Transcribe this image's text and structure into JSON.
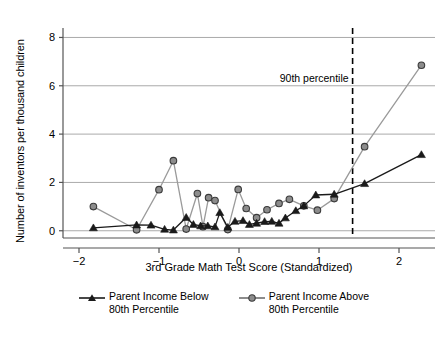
{
  "chart_data": {
    "type": "line",
    "title": "",
    "xlabel": "3rd Grade Math Test Score (Standardized)",
    "ylabel": "Number of inventors per thousand children",
    "xlim": [
      -2.2,
      2.45
    ],
    "ylim": [
      -0.3,
      8.35
    ],
    "xticks": [
      -2,
      -1,
      0,
      1,
      2
    ],
    "xticklabels": [
      "-2",
      "-1",
      "0",
      "1",
      "2"
    ],
    "yticks": [
      0,
      2,
      4,
      6,
      8
    ],
    "yticklabels": [
      "0",
      "2",
      "4",
      "6",
      "8"
    ],
    "grid": "horizontal",
    "legend_position": "below",
    "annotations": [
      {
        "text": "90th percentile",
        "x": 1.42,
        "y": 6.3,
        "type": "vline-label"
      }
    ],
    "reference_lines": [
      {
        "orientation": "vertical",
        "x": 1.42,
        "style": "dashed",
        "color": "#000000",
        "label": "90th percentile"
      }
    ],
    "series": [
      {
        "name": "Parent Income Below\n80th Percentile",
        "marker": "triangle",
        "marker_color": "#1a1a1a",
        "line_color": "#1a1a1a",
        "points": [
          {
            "x": -1.82,
            "y": 0.12
          },
          {
            "x": -1.28,
            "y": 0.24
          },
          {
            "x": -1.1,
            "y": 0.23
          },
          {
            "x": -0.93,
            "y": 0.06
          },
          {
            "x": -0.82,
            "y": 0.03
          },
          {
            "x": -0.66,
            "y": 0.55
          },
          {
            "x": -0.57,
            "y": 0.26
          },
          {
            "x": -0.48,
            "y": 0.2
          },
          {
            "x": -0.39,
            "y": 0.2
          },
          {
            "x": -0.3,
            "y": 0.16
          },
          {
            "x": -0.24,
            "y": 0.75
          },
          {
            "x": -0.14,
            "y": 0.14
          },
          {
            "x": -0.05,
            "y": 0.39
          },
          {
            "x": 0.05,
            "y": 0.42
          },
          {
            "x": 0.13,
            "y": 0.26
          },
          {
            "x": 0.22,
            "y": 0.31
          },
          {
            "x": 0.32,
            "y": 0.38
          },
          {
            "x": 0.41,
            "y": 0.39
          },
          {
            "x": 0.5,
            "y": 0.31
          },
          {
            "x": 0.58,
            "y": 0.53
          },
          {
            "x": 0.71,
            "y": 0.83
          },
          {
            "x": 0.81,
            "y": 1.03
          },
          {
            "x": 0.96,
            "y": 1.48
          },
          {
            "x": 1.19,
            "y": 1.51
          },
          {
            "x": 1.57,
            "y": 1.95
          },
          {
            "x": 2.28,
            "y": 3.15
          }
        ]
      },
      {
        "name": "Parent Income Above\n80th Percentile",
        "marker": "circle",
        "marker_color": "#8c8c8c",
        "marker_edge": "#3a3a3a",
        "line_color": "#9a9a9a",
        "points": [
          {
            "x": -1.82,
            "y": 1.0
          },
          {
            "x": -1.28,
            "y": 0.04
          },
          {
            "x": -1.0,
            "y": 1.7
          },
          {
            "x": -0.82,
            "y": 2.9
          },
          {
            "x": -0.66,
            "y": 0.07
          },
          {
            "x": -0.52,
            "y": 1.54
          },
          {
            "x": -0.45,
            "y": 0.17
          },
          {
            "x": -0.38,
            "y": 1.37
          },
          {
            "x": -0.3,
            "y": 1.25
          },
          {
            "x": -0.14,
            "y": 0.05
          },
          {
            "x": -0.01,
            "y": 1.71
          },
          {
            "x": 0.09,
            "y": 0.92
          },
          {
            "x": 0.22,
            "y": 0.54
          },
          {
            "x": 0.35,
            "y": 0.87
          },
          {
            "x": 0.5,
            "y": 1.13
          },
          {
            "x": 0.63,
            "y": 1.3
          },
          {
            "x": 0.81,
            "y": 1.03
          },
          {
            "x": 0.98,
            "y": 0.85
          },
          {
            "x": 1.19,
            "y": 1.33
          },
          {
            "x": 1.57,
            "y": 3.48
          },
          {
            "x": 2.28,
            "y": 6.85
          }
        ]
      }
    ]
  },
  "legend": {
    "entries": [
      {
        "label": "Parent Income Below\n80th Percentile",
        "marker": "triangle"
      },
      {
        "label": "Parent Income Above\n80th Percentile",
        "marker": "circle"
      }
    ]
  },
  "colors": {
    "below_series": "#1a1a1a",
    "above_series": "#9a9a9a",
    "gridline": "#aaaaaa",
    "axis": "#555555",
    "background": "#ffffff"
  }
}
